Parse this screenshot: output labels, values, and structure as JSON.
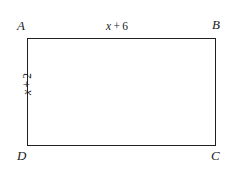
{
  "figure": {
    "type": "rectangle-diagram",
    "stroke_color": "#231f20",
    "fill_color": "#ffffff",
    "background_color": "#ffffff",
    "vertices": {
      "top_left": "A",
      "top_right": "B",
      "bottom_right": "C",
      "bottom_left": "D"
    },
    "side_labels": {
      "top": {
        "variable": "x",
        "operator": "+",
        "constant": "6",
        "full": "x + 6",
        "edge": "AB",
        "orientation": "horizontal"
      },
      "left": {
        "variable": "x",
        "operator": "+",
        "constant": "2",
        "full": "x + 2",
        "edge": "AD",
        "orientation": "rotated-90-ccw"
      }
    }
  }
}
